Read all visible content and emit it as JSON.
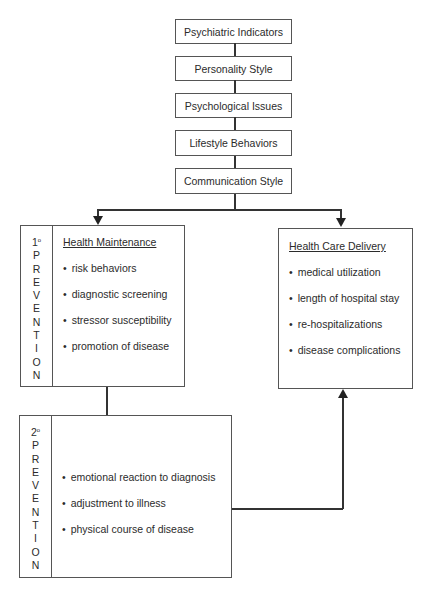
{
  "stack": [
    {
      "label": "Psychiatric Indicators"
    },
    {
      "label": "Personality Style"
    },
    {
      "label": "Psychological Issues"
    },
    {
      "label": "Lifestyle Behaviors"
    },
    {
      "label": "Communication Style"
    }
  ],
  "primary_prevention": {
    "ordinal": "1",
    "degree": "o",
    "letters": [
      "P",
      "R",
      "E",
      "V",
      "E",
      "N",
      "T",
      "I",
      "O",
      "N"
    ],
    "heading": "Health Maintenance",
    "items": [
      "risk behaviors",
      "diagnostic screening",
      "stressor susceptibility",
      "promotion of disease"
    ]
  },
  "health_care_delivery": {
    "heading": "Health Care Delivery",
    "items": [
      "medical utilization",
      "length of hospital stay",
      "re-hospitalizations",
      "disease complications"
    ]
  },
  "secondary_prevention": {
    "ordinal": "2",
    "degree": "o",
    "letters": [
      "P",
      "R",
      "E",
      "V",
      "E",
      "N",
      "T",
      "I",
      "O",
      "N"
    ],
    "items": [
      "emotional reaction to diagnosis",
      "adjustment to illness",
      "physical course of disease"
    ]
  }
}
